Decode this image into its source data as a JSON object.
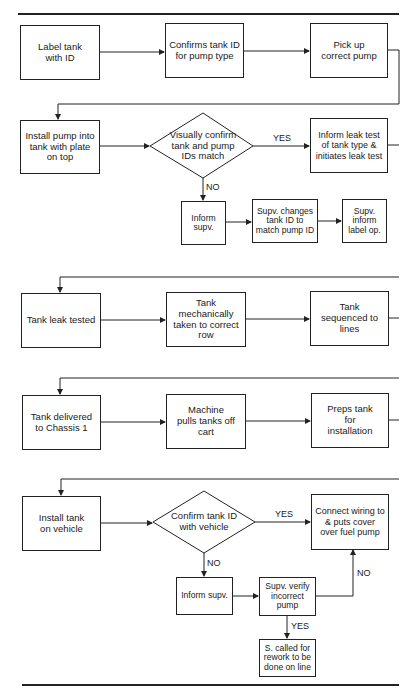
{
  "diagram": {
    "type": "process-flowchart",
    "rows": [
      {
        "steps": [
          {
            "id": "label-tank",
            "text": "Label tank with ID"
          },
          {
            "id": "confirm-tank-id",
            "text": "Confirms tank ID for pump type"
          },
          {
            "id": "pick-up-pump",
            "text": "Pick up correct pump"
          }
        ]
      },
      {
        "steps": [
          {
            "id": "install-pump",
            "text": "Install pump into tank with plate on top"
          },
          {
            "id": "decision-ids-match",
            "text": "Visually confirm tank and pump IDs match",
            "shape": "diamond"
          },
          {
            "id": "inform-leak-test",
            "text": "Inform leak test of tank type & initiates leak test"
          }
        ],
        "branch": [
          {
            "id": "inform-supv-1",
            "text": "Inform supv."
          },
          {
            "id": "supv-changes-id",
            "text": "Supv. changes tank ID to match pump ID"
          },
          {
            "id": "supv-inform-label",
            "text": "Supv. inform label op."
          }
        ]
      },
      {
        "steps": [
          {
            "id": "tank-leak-tested",
            "text": "Tank leak tested"
          },
          {
            "id": "tank-to-row",
            "text": "Tank mechanically taken to correct row"
          },
          {
            "id": "tank-sequenced",
            "text": "Tank sequenced to lines"
          }
        ]
      },
      {
        "steps": [
          {
            "id": "tank-delivered",
            "text": "Tank delivered to Chassis 1"
          },
          {
            "id": "machine-pulls",
            "text": "Machine pulls tanks off cart"
          },
          {
            "id": "preps-tank",
            "text": "Preps tank for installation"
          }
        ]
      },
      {
        "steps": [
          {
            "id": "install-tank",
            "text": "Install tank on vehicle"
          },
          {
            "id": "decision-confirm-vehicle",
            "text": "Confirm tank ID with vehicle",
            "shape": "diamond"
          },
          {
            "id": "connect-wiring",
            "text": "Connect wiring to & puts cover over fuel pump"
          }
        ],
        "branch": [
          {
            "id": "inform-supv-2",
            "text": "Inform supv."
          },
          {
            "id": "supv-verify",
            "text": "Supv. verify incorrect pump"
          },
          {
            "id": "s-called-rework",
            "text": "S. called for rework to be done on line"
          }
        ]
      }
    ],
    "labels": {
      "yes": "YES",
      "no": "NO"
    }
  }
}
